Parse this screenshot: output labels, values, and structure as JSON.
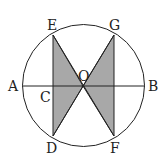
{
  "diagram": {
    "type": "geometry",
    "colors": {
      "stroke": "#222222",
      "shade": "#a8a8a8",
      "background": "#ffffff"
    },
    "labels": {
      "A": "A",
      "B": "B",
      "C": "C",
      "D": "D",
      "E": "E",
      "F": "F",
      "G": "G",
      "O": "O"
    }
  }
}
